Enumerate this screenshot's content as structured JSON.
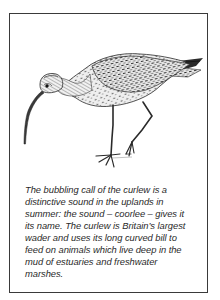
{
  "figure": {
    "subject": "curlew",
    "illustration_style": "pen-and-ink engraving",
    "border_color": "#3a3a3a",
    "ink_color": "#2a2a2a"
  },
  "caption": {
    "lines": [
      "The bubbling call of the curlew is a",
      "distinctive sound in the uplands in",
      "summer: the sound – coorlee – gives it",
      "its name. The curlew is Britain’s largest",
      "wader and uses its long curved bill to",
      "feed on animals which live deep in the",
      "mud of estuaries and freshwater",
      "marshes."
    ]
  }
}
